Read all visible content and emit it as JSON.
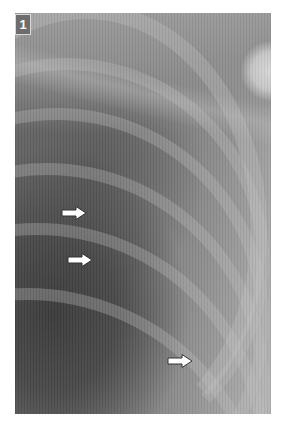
{
  "figure": {
    "panel_label": "1",
    "arrows": [
      {
        "name": "arrow-1",
        "x": 61,
        "y": 206,
        "direction": "right"
      },
      {
        "name": "arrow-2",
        "x": 67,
        "y": 253,
        "direction": "right"
      },
      {
        "name": "arrow-3",
        "x": 167,
        "y": 354,
        "direction": "right"
      }
    ],
    "colors": {
      "arrow_fill": "#ffffff",
      "arrow_outline": "#333333",
      "label_bg": "#6d6d6d",
      "label_text": "#ffffff"
    }
  }
}
